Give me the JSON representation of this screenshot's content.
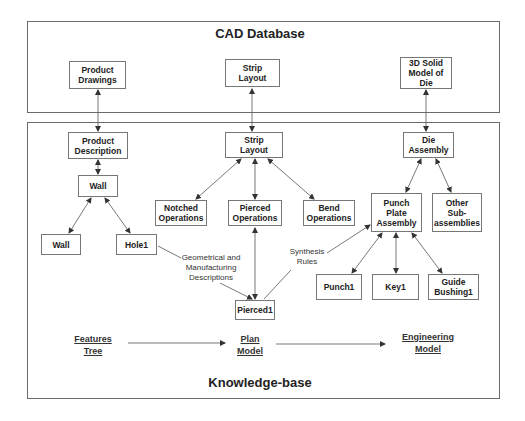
{
  "cad_database": {
    "title": "CAD Database",
    "nodes": {
      "product_drawings": "Product\nDrawings",
      "strip_layout": "Strip\nLayout",
      "solid_model": "3D Solid\nModel of\nDie"
    }
  },
  "knowledge_base": {
    "title": "Knowledge-base",
    "nodes": {
      "product_description": "Product\nDescription",
      "wall_parent": "Wall",
      "wall_child": "Wall",
      "hole1": "Hole1",
      "strip_layout": "Strip\nLayout",
      "notched_operations": "Notched\nOperations",
      "pierced_operations": "Pierced\nOperations",
      "bend_operations": "Bend\nOperations",
      "pierced1": "Pierced1",
      "die_assembly": "Die\nAssembly",
      "punch_plate_assembly": "Punch\nPlate\nAssembly",
      "other_subassemblies": "Other\nSub-\nassemblies",
      "punch1": "Punch1",
      "key1": "Key1",
      "guide_bushing1": "Guide\nBushing1"
    },
    "annotations": {
      "geometrical": "Geometrical  and\nManufacturing\nDescriptions",
      "synthesis": "Synthesis\nRules"
    },
    "model_flow": {
      "features_tree": "Features\nTree",
      "plan_model": "Plan\nModel",
      "engineering_model": "Engineering\nModel"
    }
  },
  "colors": {
    "line": "#555555",
    "border": "#777777",
    "text": "#222222"
  }
}
